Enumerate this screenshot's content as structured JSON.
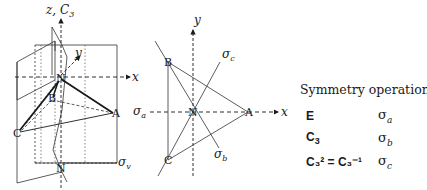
{
  "figure": {
    "left_diagram": {
      "axis_labels": {
        "z": "z, C",
        "z_sub": "3",
        "y": "y",
        "x": "x"
      },
      "atoms": {
        "N_top": "N",
        "N_bottom": "N",
        "A": "A",
        "B": "B",
        "C": "C"
      },
      "plane_labels": {
        "sigma_v": "σ",
        "sigma_v_sub": "v"
      }
    },
    "right_diagram": {
      "axis_labels": {
        "y": "y",
        "x": "x"
      },
      "atoms": {
        "N": "N",
        "A": "A",
        "B": "B",
        "C": "C"
      },
      "plane_labels": {
        "sigma_a": "σ",
        "sigma_a_sub": "a",
        "sigma_b": "σ",
        "sigma_b_sub": "b",
        "sigma_c": "σ",
        "sigma_c_sub": "c"
      }
    },
    "symmetry_panel": {
      "title": "Symmetry operations:",
      "rows": [
        {
          "left": "E",
          "right": "σ",
          "right_sub": "a"
        },
        {
          "left": "C",
          "left_sub": "3",
          "right": "σ",
          "right_sub": "b"
        },
        {
          "left_html": "C₃² = C₃⁻¹",
          "right": "σ",
          "right_sub": "c"
        }
      ]
    }
  }
}
